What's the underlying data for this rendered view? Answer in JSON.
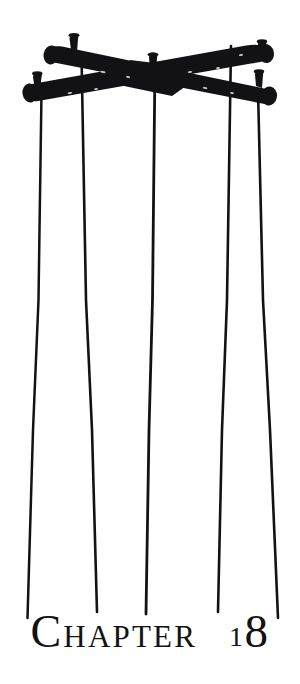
{
  "page": {
    "kind": "book-chapter-opening-illustration",
    "background_color": "#ffffff",
    "ink_color": "#121214",
    "width": 300,
    "height": 684
  },
  "illustration": {
    "subject": "marionette-control-cross-with-strings",
    "description": "Two crossed wooden puppet control bars in solid black silhouette with small pegs, five thin strings hanging down the page",
    "bar_color": "#121214",
    "string_color": "#121214",
    "strings": [
      {
        "name": "string-1",
        "x_top": 41,
        "y_top": 92,
        "x_bottom": 27,
        "y_bottom": 618
      },
      {
        "name": "string-2",
        "x_top": 82,
        "y_top": 55,
        "x_bottom": 97,
        "y_bottom": 612
      },
      {
        "name": "string-3",
        "x_top": 155,
        "y_top": 62,
        "x_bottom": 146,
        "y_bottom": 614
      },
      {
        "name": "string-4",
        "x_top": 231,
        "y_top": 46,
        "x_bottom": 218,
        "y_bottom": 612
      },
      {
        "name": "string-5",
        "x_top": 258,
        "y_top": 90,
        "x_bottom": 278,
        "y_bottom": 618
      }
    ],
    "bars": [
      {
        "name": "upper-bar",
        "from": [
          47,
          57
        ],
        "to": [
          271,
          100
        ],
        "pegs": 3
      },
      {
        "name": "lower-bar",
        "from": [
          25,
          100
        ],
        "to": [
          275,
          60
        ],
        "pegs": 3
      }
    ]
  },
  "heading": {
    "full_text": "CHAPTER 18",
    "word": "Chapter",
    "drop_letter": "C",
    "remaining_letters": "HAPTER",
    "number": "18",
    "number_first_digit": "1",
    "number_second_digit": "8",
    "style": "small-caps-serif-oldstyle-figures"
  }
}
